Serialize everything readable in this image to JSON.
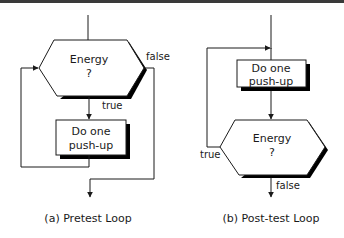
{
  "diagrams": [
    {
      "id": "a",
      "caption": "(a) Pretest Loop",
      "decision": {
        "line1": "Energy",
        "line2": "?"
      },
      "process": {
        "line1": "Do one",
        "line2": "push-up"
      },
      "edges": {
        "true_label": "true",
        "false_label": "false"
      }
    },
    {
      "id": "b",
      "caption": "(b) Post-test Loop",
      "decision": {
        "line1": "Energy",
        "line2": "?"
      },
      "process": {
        "line1": "Do one",
        "line2": "push-up"
      },
      "edges": {
        "true_label": "true",
        "false_label": "false"
      }
    }
  ],
  "colors": {
    "stroke": "#1a1a1a",
    "shadow": "#000000",
    "fill": "#ffffff",
    "topbar": "#3a3a3a"
  }
}
